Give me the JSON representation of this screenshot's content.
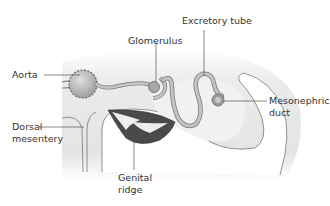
{
  "diagram": {
    "type": "biological cross-section",
    "labels": {
      "excretory_tube": "Excretory tube",
      "glomerulus": "Glomerulus",
      "aorta": "Aorta",
      "mesonephric_duct_line1": "Mesonephric",
      "mesonephric_duct_line2": "duct",
      "dorsal_mesentery_line1": "Dorsal",
      "dorsal_mesentery_line2": "mesentery",
      "genital_ridge_line1": "Genital",
      "genital_ridge_line2": "ridge"
    },
    "colors": {
      "tissue_fill": "#e6e6e6",
      "tube_fill": "#b5b5b5",
      "outline": "#666666",
      "genital_ridge_dark": "#4a4a4a",
      "label_text": "#333333",
      "leader_line": "#555555"
    }
  }
}
